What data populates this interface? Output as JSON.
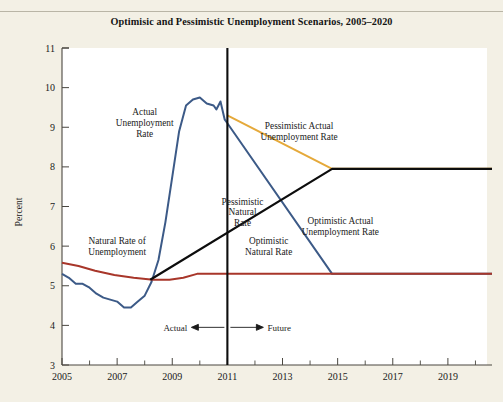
{
  "figure": {
    "title": "Optimisic and Pessimistic Unemployment Scenarios, 2005–2020",
    "background_color": "#f3f0e5"
  },
  "chart_data": {
    "type": "line",
    "title": "Optimisic and Pessimistic Unemployment Scenarios, 2005–2020",
    "xlabel": "",
    "ylabel": "Percent",
    "xlim": [
      2005,
      2020.6
    ],
    "ylim": [
      3,
      11
    ],
    "ytick_labels": [
      "3",
      "4",
      "5",
      "6",
      "7",
      "8",
      "9",
      "10",
      "11"
    ],
    "ytick_values": [
      3,
      4,
      5,
      6,
      7,
      8,
      9,
      10,
      11
    ],
    "xtick_labels": [
      "2005",
      "2007",
      "2009",
      "2011",
      "2013",
      "2015",
      "2017",
      "2019"
    ],
    "xtick_values": [
      2005,
      2007,
      2009,
      2011,
      2013,
      2015,
      2017,
      2019
    ],
    "xminor_tick_values": [
      2006,
      2008,
      2010,
      2012,
      2014,
      2016,
      2018,
      2020
    ],
    "grid": false,
    "legend_position": "inline-annotations",
    "divider": {
      "x": 2011.0,
      "left_label": "Actual",
      "right_label": "Future",
      "color": "#0d0d0d"
    },
    "series": [
      {
        "name": "Actual Unemployment Rate",
        "label": "Actual\nUnemployment\nRate",
        "color": "#3c5a87",
        "width": 2.0,
        "points": [
          [
            2005.0,
            5.3
          ],
          [
            2005.25,
            5.2
          ],
          [
            2005.5,
            5.05
          ],
          [
            2005.75,
            5.05
          ],
          [
            2006.0,
            4.95
          ],
          [
            2006.25,
            4.8
          ],
          [
            2006.5,
            4.7
          ],
          [
            2006.75,
            4.65
          ],
          [
            2007.0,
            4.6
          ],
          [
            2007.25,
            4.45
          ],
          [
            2007.5,
            4.45
          ],
          [
            2007.75,
            4.6
          ],
          [
            2008.0,
            4.75
          ],
          [
            2008.25,
            5.1
          ],
          [
            2008.5,
            5.65
          ],
          [
            2008.75,
            6.6
          ],
          [
            2009.0,
            7.75
          ],
          [
            2009.25,
            8.9
          ],
          [
            2009.5,
            9.55
          ],
          [
            2009.75,
            9.7
          ],
          [
            2010.0,
            9.75
          ],
          [
            2010.25,
            9.6
          ],
          [
            2010.5,
            9.55
          ],
          [
            2010.6,
            9.45
          ],
          [
            2010.75,
            9.65
          ],
          [
            2010.9,
            9.2
          ],
          [
            2011.0,
            9.1
          ]
        ]
      },
      {
        "name": "Optimistic Actual Unemployment Rate",
        "label": "Optimistic Actual\nUnemployment Rate",
        "color": "#3c5a87",
        "width": 2.0,
        "points": [
          [
            2011.0,
            9.1
          ],
          [
            2014.8,
            5.3
          ],
          [
            2020.6,
            5.3
          ]
        ]
      },
      {
        "name": "Pessimistic Actual Unemployment Rate",
        "label": "Pessimistic Actual\nUnemployment Rate",
        "color": "#e5a93a",
        "width": 2.0,
        "points": [
          [
            2011.0,
            9.3
          ],
          [
            2014.8,
            7.95
          ],
          [
            2020.6,
            7.95
          ]
        ]
      },
      {
        "name": "Natural Rate of Unemployment",
        "label": "Natural Rate of\nUnemployment",
        "color": "#a8362a",
        "width": 2.0,
        "points": [
          [
            2005.0,
            5.58
          ],
          [
            2005.6,
            5.5
          ],
          [
            2006.2,
            5.38
          ],
          [
            2006.9,
            5.27
          ],
          [
            2007.6,
            5.2
          ],
          [
            2008.3,
            5.15
          ],
          [
            2008.9,
            5.15
          ],
          [
            2009.4,
            5.2
          ],
          [
            2009.9,
            5.3
          ],
          [
            2010.4,
            5.3
          ],
          [
            2011.0,
            5.3
          ]
        ]
      },
      {
        "name": "Optimistic Natural Rate",
        "label": "Optimistic\nNatural Rate",
        "color": "#a8362a",
        "width": 2.0,
        "points": [
          [
            2011.0,
            5.3
          ],
          [
            2020.6,
            5.3
          ]
        ]
      },
      {
        "name": "Pessimistic Natural Rate",
        "label": "Pessimistic\nNatural\nRate",
        "color": "#0d0d0d",
        "width": 2.2,
        "points": [
          [
            2008.2,
            5.15
          ],
          [
            2014.8,
            7.95
          ],
          [
            2020.6,
            7.95
          ]
        ]
      }
    ],
    "annotations": [
      {
        "name": "actual-unemployment-rate-label",
        "lines": [
          "Actual",
          "Unemployment",
          "Rate"
        ],
        "x": 2008.0,
        "y": 9.3
      },
      {
        "name": "pessimistic-actual-label",
        "lines": [
          "Pessimistic Actual",
          "Unemployment Rate"
        ],
        "x": 2013.6,
        "y": 8.95
      },
      {
        "name": "pessimistic-natural-rate-label",
        "lines": [
          "Pessimistic",
          "Natural",
          "Rate"
        ],
        "x": 2011.55,
        "y": 7.05
      },
      {
        "name": "optimistic-actual-label",
        "lines": [
          "Optimistic Actual",
          "Unemployment Rate"
        ],
        "x": 2015.1,
        "y": 6.55
      },
      {
        "name": "natural-rate-label",
        "lines": [
          "Natural Rate of",
          "Unemployment"
        ],
        "x": 2007.0,
        "y": 6.05
      },
      {
        "name": "optimistic-natural-rate-label",
        "lines": [
          "Optimistic",
          "Natural Rate"
        ],
        "x": 2012.5,
        "y": 6.05
      }
    ]
  }
}
